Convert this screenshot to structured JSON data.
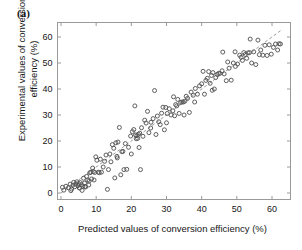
{
  "figure": {
    "panel_label": "(a)",
    "background_color": "#ffffff",
    "axis_color": "#9a9a9a",
    "marker_color": "#555555",
    "line_color": "#8f8f8f"
  },
  "chart_data": {
    "type": "scatter",
    "title": "",
    "subtitle": "",
    "xlabel": "Predicted values of conversion efficiency (%)",
    "ylabel": "Experimental values of conversion\nefficiency (%)",
    "ylabel_line1": "Experimental values of conversion",
    "ylabel_line2": "efficiency (%)",
    "xlim": [
      -2,
      64
    ],
    "ylim": [
      -2,
      64
    ],
    "xticks": [
      0,
      10,
      20,
      30,
      40,
      50,
      60
    ],
    "yticks": [
      0,
      10,
      20,
      30,
      40,
      50,
      60
    ],
    "xticklabels": [
      "0",
      "10",
      "20",
      "30",
      "40",
      "50",
      "60"
    ],
    "yticklabels": [
      "0",
      "10",
      "20",
      "30",
      "40",
      "50",
      "60"
    ],
    "grid": false,
    "legend": null,
    "marker": "open-circle",
    "marker_size": 4,
    "reference_line": {
      "type": "identity",
      "style": "dashed",
      "slope": 1,
      "intercept": 0,
      "from": [
        0,
        0
      ],
      "to": [
        63,
        63
      ]
    },
    "series": [
      {
        "name": "conversion efficiency",
        "points": [
          [
            0.4,
            2.2
          ],
          [
            0.8,
            1.1
          ],
          [
            1.4,
            2.6
          ],
          [
            2.1,
            2.0
          ],
          [
            2.6,
            3.4
          ],
          [
            3.0,
            1.5
          ],
          [
            3.4,
            3.0
          ],
          [
            3.6,
            4.1
          ],
          [
            3.9,
            2.4
          ],
          [
            4.2,
            3.5
          ],
          [
            4.5,
            4.3
          ],
          [
            4.8,
            2.8
          ],
          [
            5.0,
            3.6
          ],
          [
            5.3,
            1.9
          ],
          [
            5.5,
            4.0
          ],
          [
            5.8,
            3.2
          ],
          [
            6.0,
            1.0
          ],
          [
            6.2,
            2.6
          ],
          [
            6.4,
            5.7
          ],
          [
            6.7,
            3.8
          ],
          [
            7.0,
            2.3
          ],
          [
            7.3,
            6.4
          ],
          [
            7.6,
            5.0
          ],
          [
            7.9,
            3.1
          ],
          [
            8.2,
            7.8
          ],
          [
            8.5,
            8.0
          ],
          [
            8.7,
            5.4
          ],
          [
            9.0,
            9.6
          ],
          [
            9.2,
            8.2
          ],
          [
            9.6,
            7.9
          ],
          [
            9.9,
            13.9
          ],
          [
            10.2,
            12.6
          ],
          [
            10.6,
            8.0
          ],
          [
            10.9,
            7.8
          ],
          [
            11.2,
            13.0
          ],
          [
            12.0,
            10.0
          ],
          [
            12.4,
            12.2
          ],
          [
            12.8,
            14.6
          ],
          [
            13.2,
            1.4
          ],
          [
            13.5,
            9.0
          ],
          [
            13.9,
            15.0
          ],
          [
            14.2,
            12.0
          ],
          [
            14.6,
            18.6
          ],
          [
            15.0,
            17.2
          ],
          [
            15.3,
            5.8
          ],
          [
            15.6,
            19.3
          ],
          [
            15.9,
            14.1
          ],
          [
            16.2,
            19.6
          ],
          [
            16.6,
            25.2
          ],
          [
            17.0,
            7.0
          ],
          [
            17.3,
            15.9
          ],
          [
            17.6,
            16.0
          ],
          [
            17.9,
            9.0
          ],
          [
            18.3,
            19.0
          ],
          [
            18.7,
            9.1
          ],
          [
            19.2,
            17.6
          ],
          [
            19.8,
            21.9
          ],
          [
            20.3,
            23.6
          ],
          [
            20.7,
            24.4
          ],
          [
            21.0,
            33.5
          ],
          [
            21.2,
            22.3
          ],
          [
            21.4,
            20.9
          ],
          [
            21.6,
            22.1
          ],
          [
            21.8,
            21.0
          ],
          [
            22.0,
            22.6
          ],
          [
            22.2,
            17.5
          ],
          [
            22.4,
            23.0
          ],
          [
            22.6,
            9.0
          ],
          [
            22.9,
            25.1
          ],
          [
            23.3,
            21.8
          ],
          [
            23.8,
            28.0
          ],
          [
            24.2,
            26.9
          ],
          [
            24.6,
            31.4
          ],
          [
            25.0,
            23.2
          ],
          [
            25.6,
            27.2
          ],
          [
            26.2,
            28.6
          ],
          [
            26.6,
            39.4
          ],
          [
            27.0,
            22.5
          ],
          [
            27.4,
            29.6
          ],
          [
            27.8,
            27.4
          ],
          [
            28.2,
            26.3
          ],
          [
            28.6,
            30.7
          ],
          [
            29.0,
            33.0
          ],
          [
            29.4,
            24.3
          ],
          [
            29.8,
            32.9
          ],
          [
            30.2,
            30.6
          ],
          [
            30.8,
            32.4
          ],
          [
            31.3,
            30.0
          ],
          [
            31.8,
            31.6
          ],
          [
            32.0,
            37.0
          ],
          [
            32.3,
            29.7
          ],
          [
            32.6,
            34.0
          ],
          [
            32.9,
            33.5
          ],
          [
            33.2,
            36.0
          ],
          [
            33.6,
            30.6
          ],
          [
            34.0,
            34.8
          ],
          [
            34.4,
            35.0
          ],
          [
            34.8,
            35.0
          ],
          [
            35.2,
            35.3
          ],
          [
            35.6,
            37.2
          ],
          [
            36.0,
            36.4
          ],
          [
            36.5,
            31.0
          ],
          [
            37.0,
            38.8
          ],
          [
            37.6,
            37.6
          ],
          [
            38.2,
            40.2
          ],
          [
            38.8,
            38.0
          ],
          [
            39.4,
            41.2
          ],
          [
            40.0,
            42.0
          ],
          [
            40.4,
            46.8
          ],
          [
            40.8,
            38.0
          ],
          [
            41.2,
            43.3
          ],
          [
            41.6,
            44.1
          ],
          [
            42.0,
            46.7
          ],
          [
            42.4,
            42.2
          ],
          [
            42.8,
            45.2
          ],
          [
            43.2,
            46.3
          ],
          [
            43.6,
            40.0
          ],
          [
            44.0,
            44.4
          ],
          [
            44.4,
            45.6
          ],
          [
            44.8,
            46.0
          ],
          [
            45.2,
            46.0
          ],
          [
            45.8,
            47.0
          ],
          [
            46.4,
            45.8
          ],
          [
            47.0,
            43.2
          ],
          [
            47.4,
            50.4
          ],
          [
            47.8,
            48.0
          ],
          [
            48.4,
            43.4
          ],
          [
            49.0,
            50.0
          ],
          [
            49.6,
            48.7
          ],
          [
            50.2,
            49.6
          ],
          [
            50.8,
            53.0
          ],
          [
            51.2,
            52.2
          ],
          [
            51.6,
            51.0
          ],
          [
            52.0,
            54.0
          ],
          [
            52.4,
            53.3
          ],
          [
            52.8,
            51.8
          ],
          [
            53.2,
            53.9
          ],
          [
            53.6,
            54.0
          ],
          [
            53.8,
            59.2
          ],
          [
            54.2,
            50.0
          ],
          [
            54.8,
            54.3
          ],
          [
            55.4,
            49.4
          ],
          [
            56.0,
            58.8
          ],
          [
            56.4,
            53.2
          ],
          [
            56.8,
            55.0
          ],
          [
            57.4,
            53.0
          ],
          [
            58.0,
            56.8
          ],
          [
            58.6,
            52.9
          ],
          [
            59.2,
            57.0
          ],
          [
            59.8,
            53.4
          ],
          [
            60.4,
            56.0
          ],
          [
            61.0,
            57.3
          ],
          [
            61.6,
            55.0
          ],
          [
            62.0,
            57.4
          ],
          [
            62.4,
            57.3
          ],
          [
            49.5,
            54.3
          ],
          [
            46.0,
            54.2
          ],
          [
            43.0,
            39.5
          ],
          [
            38.0,
            35.0
          ],
          [
            35.0,
            30.0
          ],
          [
            30.0,
            27.0
          ],
          [
            25.5,
            25.0
          ],
          [
            20.0,
            15.0
          ],
          [
            16.0,
            13.5
          ],
          [
            11.5,
            8.0
          ],
          [
            8.0,
            4.6
          ],
          [
            5.2,
            2.0
          ],
          [
            2.8,
            0.9
          ],
          [
            6.8,
            2.5
          ],
          [
            9.4,
            5.0
          ]
        ]
      }
    ]
  }
}
